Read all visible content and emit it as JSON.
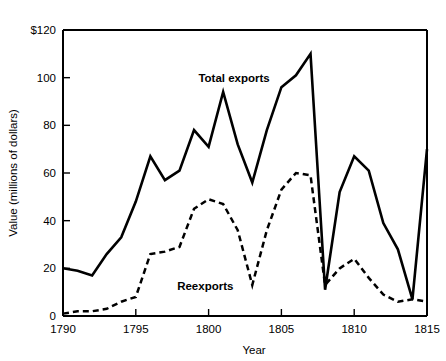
{
  "chart_data": {
    "type": "line",
    "title": "",
    "xlabel": "Year",
    "ylabel": "Value (millions of dollars)",
    "xlim": [
      1790,
      1815
    ],
    "ylim": [
      0,
      120
    ],
    "grid": false,
    "legend_position": "inline-annotations",
    "x_ticks": [
      "1790",
      "1795",
      "1800",
      "1805",
      "1810",
      "1815"
    ],
    "x_tick_values": [
      1790,
      1795,
      1800,
      1805,
      1810,
      1815
    ],
    "y_ticks": [
      "0",
      "20",
      "40",
      "60",
      "80",
      "100",
      "$120"
    ],
    "y_tick_values": [
      0,
      20,
      40,
      60,
      80,
      100,
      120
    ],
    "x": [
      1790,
      1791,
      1792,
      1793,
      1794,
      1795,
      1796,
      1797,
      1798,
      1799,
      1800,
      1801,
      1802,
      1803,
      1804,
      1805,
      1806,
      1807,
      1808,
      1809,
      1810,
      1811,
      1812,
      1813,
      1814,
      1815
    ],
    "series": [
      {
        "name": "Total exports",
        "style": "solid",
        "color": "#000000",
        "label_x": 1799.3,
        "label_y": 98,
        "values": [
          20,
          19,
          17,
          26,
          33,
          48,
          67,
          57,
          61,
          78,
          71,
          94,
          72,
          56,
          78,
          96,
          101,
          110,
          11,
          52,
          67,
          61,
          39,
          28,
          7,
          70
        ]
      },
      {
        "name": "Reexports",
        "style": "dashed",
        "color": "#000000",
        "label_x": 1801.7,
        "label_y": 11,
        "values": [
          1,
          2,
          2,
          3,
          6,
          8,
          26,
          27,
          29,
          45,
          49,
          47,
          36,
          13,
          36,
          53,
          60,
          59,
          13,
          20,
          24,
          16,
          9,
          6,
          7,
          6
        ]
      }
    ]
  }
}
